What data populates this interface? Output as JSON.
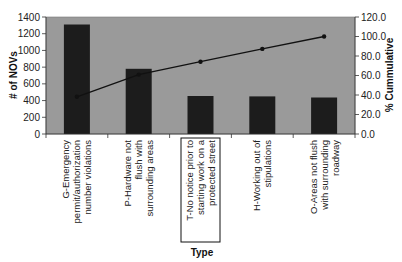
{
  "chart_data": {
    "type": "bar",
    "title": "",
    "xlabel": "Type",
    "ylabel": "# of NOVs",
    "y2label": "% Cummulative",
    "ylim": [
      0,
      1400
    ],
    "y2lim": [
      0,
      120
    ],
    "yticks": [
      "0",
      "200",
      "400",
      "600",
      "800",
      "1000",
      "1200",
      "1400"
    ],
    "y2ticks": [
      "0.0",
      "20.0",
      "40.0",
      "60.0",
      "80.0",
      "100.0",
      "120.0"
    ],
    "grid": false,
    "legend": null,
    "categories": [
      [
        "G-Emergency",
        "permit/authorization",
        "number violations"
      ],
      [
        "P-Hardware not",
        "flush with",
        "surrounding areas"
      ],
      [
        "T-No notice prior to",
        "starting work on a",
        "protected street"
      ],
      [
        "H-Working out of",
        "stipulations"
      ],
      [
        "O-Areas not flush",
        "with surrounding",
        "roadway"
      ]
    ],
    "series": [
      {
        "name": "# of NOVs",
        "type": "bar",
        "axis": "left",
        "color": "#1c1c1c",
        "values": [
          1310,
          780,
          455,
          450,
          437
        ]
      },
      {
        "name": "% Cummulative",
        "type": "line",
        "axis": "right",
        "color": "#111111",
        "values": [
          38.2,
          60.9,
          74.2,
          87.3,
          100.0
        ]
      }
    ],
    "highlighted_category_index": 2,
    "plot_background": "#9a9a9a"
  }
}
